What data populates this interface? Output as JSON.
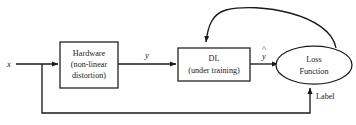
{
  "diagram": {
    "background_color": "#ffffff",
    "stroke_color": "#1a1a1a",
    "nodes": {
      "input": {
        "name": "input-signal",
        "label": "x"
      },
      "hardware": {
        "name": "hardware-block",
        "line1": "Hardware",
        "line2": "(non-linear",
        "line3": "distortion)",
        "shape": "rectangle"
      },
      "dl": {
        "name": "dl-block",
        "line1": "DL",
        "line2": "(under training)",
        "shape": "rectangle"
      },
      "loss": {
        "name": "loss-function-node",
        "line1": "Loss",
        "line2": "Function",
        "shape": "ellipse"
      }
    },
    "edges": {
      "hardware_out": {
        "name": "hardware-output-label",
        "label": "y"
      },
      "dl_out": {
        "name": "dl-output-label",
        "label": "y",
        "accent": "^"
      },
      "label_feedback": {
        "name": "label-feedback-label",
        "label": "Label"
      }
    }
  }
}
